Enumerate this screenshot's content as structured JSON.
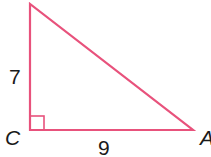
{
  "figure": {
    "type": "right-triangle",
    "stroke_color": "#e8527c",
    "vertices": {
      "top": {
        "label": ""
      },
      "C": {
        "label": "C"
      },
      "A": {
        "label": "A"
      }
    },
    "sides": {
      "vertical": {
        "label": "7"
      },
      "horizontal": {
        "label": "9"
      }
    },
    "right_angle_at": "C"
  }
}
